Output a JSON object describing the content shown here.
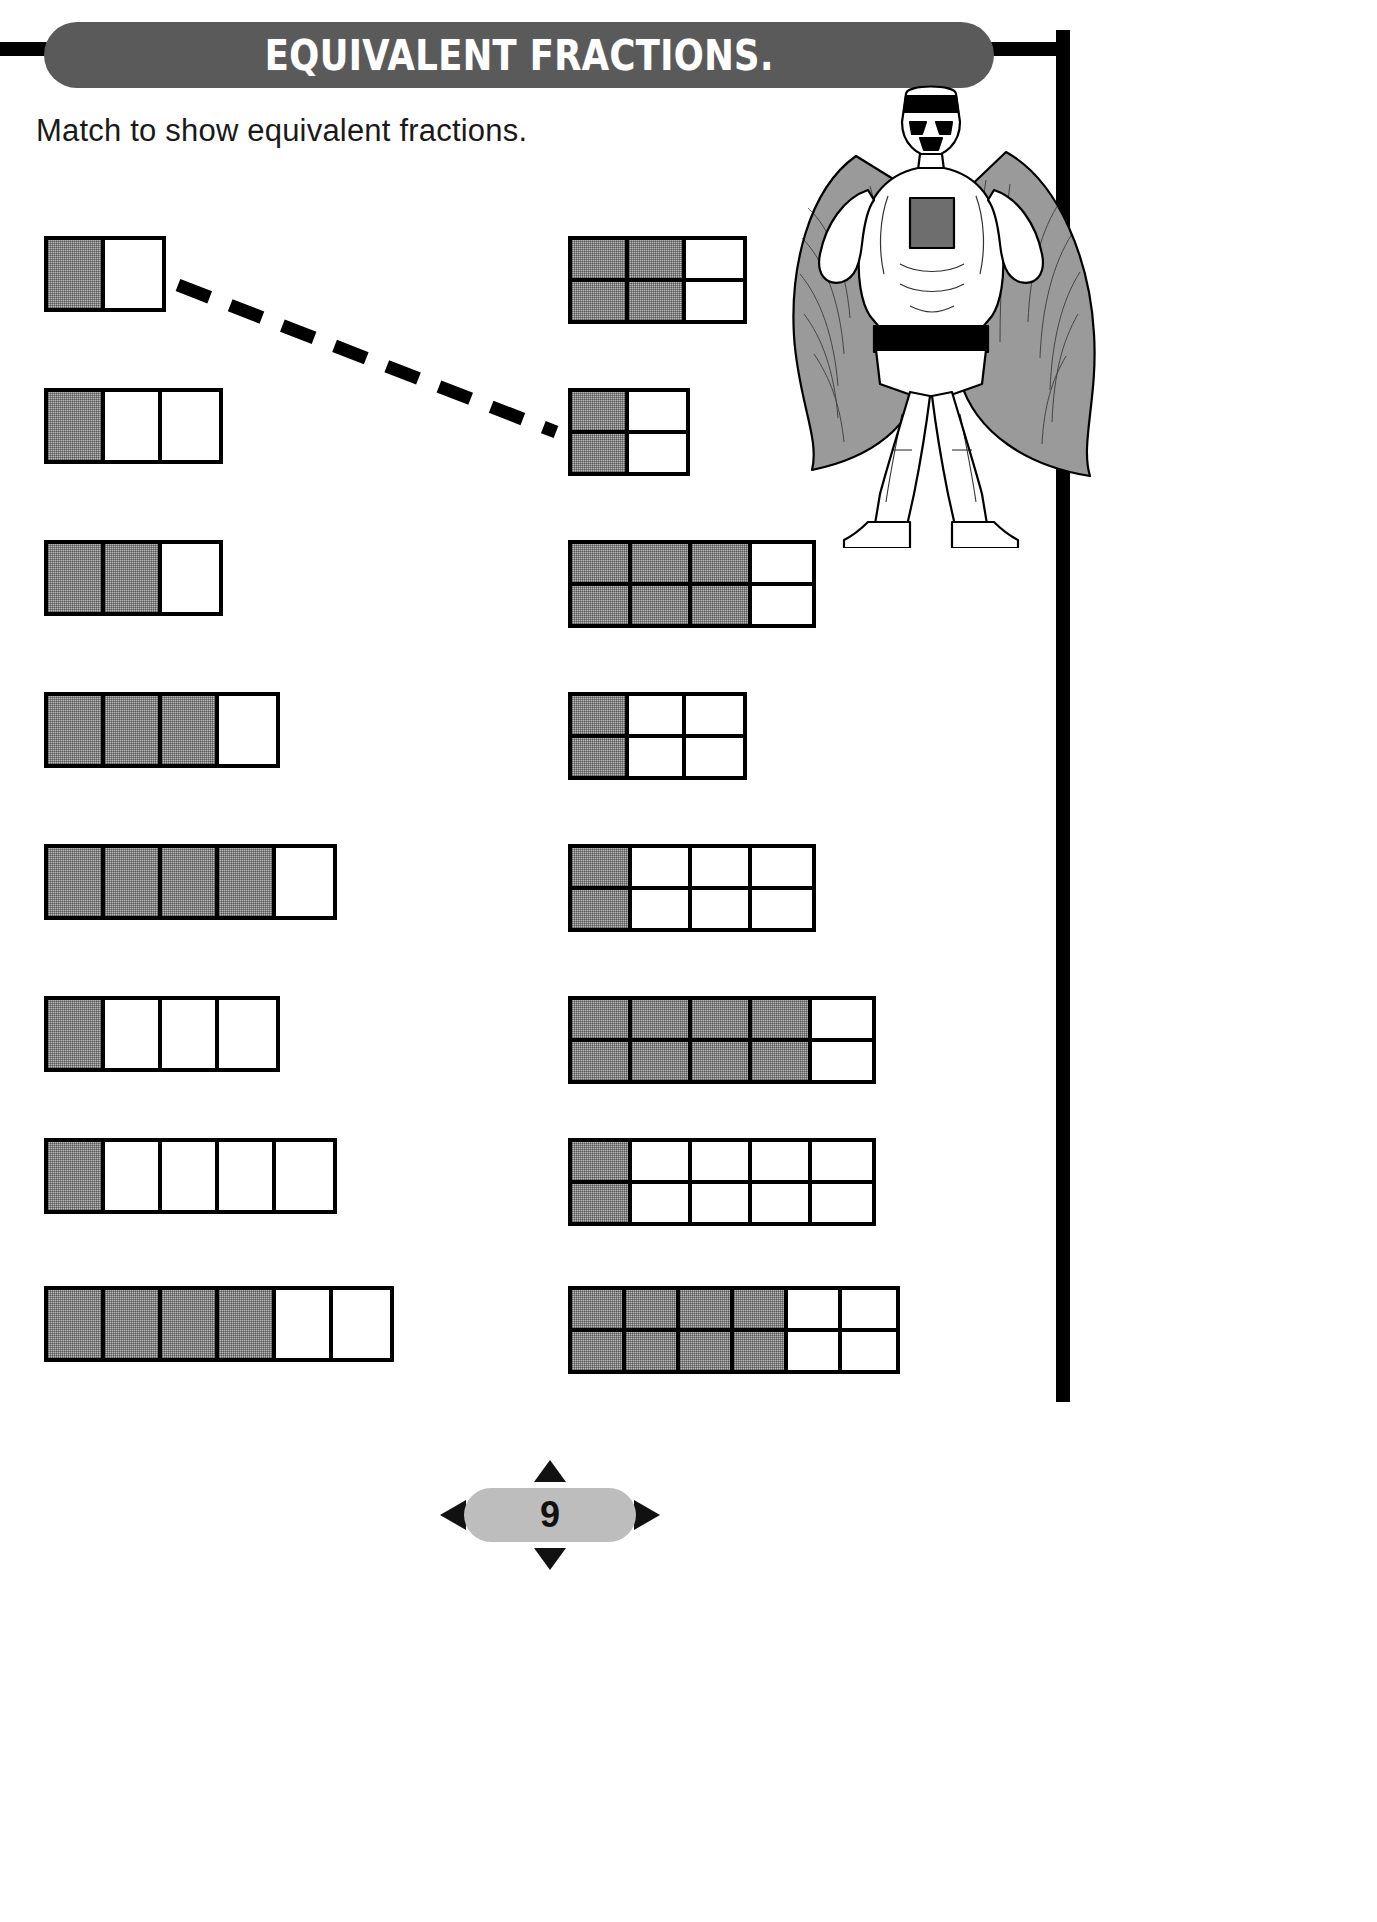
{
  "page": {
    "title": "EQUIVALENT FRACTIONS.",
    "instruction": "Match to show equivalent fractions.",
    "page_number": "9",
    "colors": {
      "banner_background": "#5a5a5a",
      "banner_text": "#ffffff",
      "shaded_cell": "#b9b9b9",
      "unshaded_cell": "#ffffff",
      "outline": "#000000",
      "footer_badge": "#bdbdbd"
    }
  },
  "left_column": {
    "label": "single-row fraction bars",
    "items": [
      {
        "id": "left-1",
        "fraction": "1/2",
        "total": 2,
        "shaded": 1,
        "cell_width": 57,
        "height": 76,
        "x": 44,
        "y": 236
      },
      {
        "id": "left-2",
        "fraction": "1/3",
        "total": 3,
        "shaded": 1,
        "cell_width": 57,
        "height": 76,
        "x": 44,
        "y": 388
      },
      {
        "id": "left-3",
        "fraction": "2/3",
        "total": 3,
        "shaded": 2,
        "cell_width": 57,
        "height": 76,
        "x": 44,
        "y": 540
      },
      {
        "id": "left-4",
        "fraction": "3/4",
        "total": 4,
        "shaded": 3,
        "cell_width": 57,
        "height": 76,
        "x": 44,
        "y": 692
      },
      {
        "id": "left-5",
        "fraction": "4/5",
        "total": 5,
        "shaded": 4,
        "cell_width": 57,
        "height": 76,
        "x": 44,
        "y": 844
      },
      {
        "id": "left-6",
        "fraction": "1/4",
        "total": 4,
        "shaded": 1,
        "cell_width": 57,
        "height": 76,
        "x": 44,
        "y": 996
      },
      {
        "id": "left-7",
        "fraction": "1/5",
        "total": 5,
        "shaded": 1,
        "cell_width": 57,
        "height": 76,
        "x": 44,
        "y": 1138
      },
      {
        "id": "left-8",
        "fraction": "4/6",
        "total": 6,
        "shaded": 4,
        "cell_width": 57,
        "height": 76,
        "x": 44,
        "y": 1286
      }
    ]
  },
  "right_column": {
    "label": "two-row fraction grids",
    "items": [
      {
        "id": "right-1",
        "fraction": "4/6",
        "columns": 3,
        "rows": 2,
        "shaded_columns": 2,
        "cell_width": 57,
        "cell_height": 38,
        "x": 568,
        "y": 236
      },
      {
        "id": "right-2",
        "fraction": "2/4",
        "columns": 2,
        "rows": 2,
        "shaded_columns": 1,
        "cell_width": 57,
        "cell_height": 38,
        "x": 568,
        "y": 388
      },
      {
        "id": "right-3",
        "fraction": "6/8",
        "columns": 4,
        "rows": 2,
        "shaded_columns": 3,
        "cell_width": 60,
        "cell_height": 38,
        "x": 568,
        "y": 540
      },
      {
        "id": "right-4",
        "fraction": "2/6",
        "columns": 3,
        "rows": 2,
        "shaded_columns": 1,
        "cell_width": 57,
        "cell_height": 38,
        "x": 568,
        "y": 692
      },
      {
        "id": "right-5",
        "fraction": "2/8",
        "columns": 4,
        "rows": 2,
        "shaded_columns": 1,
        "cell_width": 60,
        "cell_height": 38,
        "x": 568,
        "y": 844
      },
      {
        "id": "right-6",
        "fraction": "8/10",
        "columns": 5,
        "rows": 2,
        "shaded_columns": 4,
        "cell_width": 60,
        "cell_height": 38,
        "x": 568,
        "y": 996
      },
      {
        "id": "right-7",
        "fraction": "2/10",
        "columns": 5,
        "rows": 2,
        "shaded_columns": 1,
        "cell_width": 60,
        "cell_height": 38,
        "x": 568,
        "y": 1138
      },
      {
        "id": "right-8",
        "fraction": "8/12",
        "columns": 6,
        "rows": 2,
        "shaded_columns": 4,
        "cell_width": 54,
        "cell_height": 38,
        "x": 568,
        "y": 1286
      }
    ]
  },
  "match_line": {
    "description": "dashed line joining 1/2 bar to 2/4 grid",
    "from": "left-1",
    "to": "right-2",
    "x1": 178,
    "y1": 285,
    "x2": 556,
    "y2": 432
  },
  "clipart": {
    "name": "superhero-in-cape",
    "alt": "Cartoon superhero standing with cape"
  }
}
